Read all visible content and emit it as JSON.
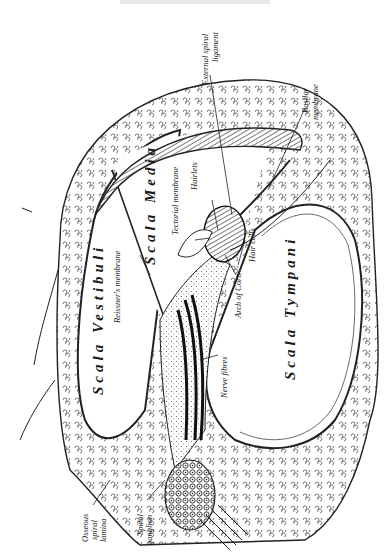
{
  "figure": {
    "labels": {
      "scala_vestibuli": "Scala Vestibuli",
      "scala_media": "Scala Media",
      "scala_tympani": "Scala Tympani",
      "reissners_membrane": "Reissner's membrane",
      "tectorial_membrane": "Tectorial membrane",
      "hairlets": "Hairlets",
      "external_spiral_ligament_1": "External spiral",
      "external_spiral_ligament_2": "ligament",
      "basilar_membrane_1": "Basilar",
      "basilar_membrane_2": "membrane",
      "hair_cells": "Hair cells",
      "arch_of_corti": "Arch of Corti",
      "nerve_fibres": "Nerve fibres",
      "osseous_spiral_lamina_1": "Osseous",
      "osseous_spiral_lamina_2": "spiral",
      "osseous_spiral_lamina_3": "lamina",
      "spiral_ganglion_1": "Spiral",
      "spiral_ganglion_2": "ganglion"
    },
    "colors": {
      "ink": "#1a1a1a",
      "paper": "#ffffff"
    }
  }
}
